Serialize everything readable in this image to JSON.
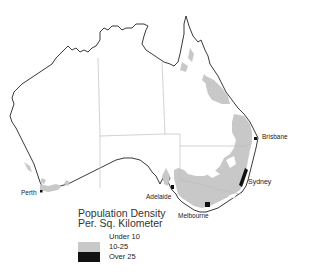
{
  "map": {
    "subject": "Australia",
    "colors": {
      "under_10": "#ffffff",
      "10_25": "#c8c8c8",
      "over_25": "#111111",
      "coastline": "#222222",
      "state_borders": "#bdbdbd"
    }
  },
  "cities": [
    {
      "name": "Brisbane"
    },
    {
      "name": "Sydney"
    },
    {
      "name": "Melbourne"
    },
    {
      "name": "Adelaide"
    },
    {
      "name": "Perth"
    }
  ],
  "legend": {
    "title_line1": "Population Density",
    "title_line2": "Per. Sq. Kilometer",
    "items": [
      {
        "label": "Under 10",
        "color": "#ffffff"
      },
      {
        "label": "10-25",
        "color": "#c8c8c8"
      },
      {
        "label": "Over 25",
        "color": "#111111"
      }
    ]
  }
}
